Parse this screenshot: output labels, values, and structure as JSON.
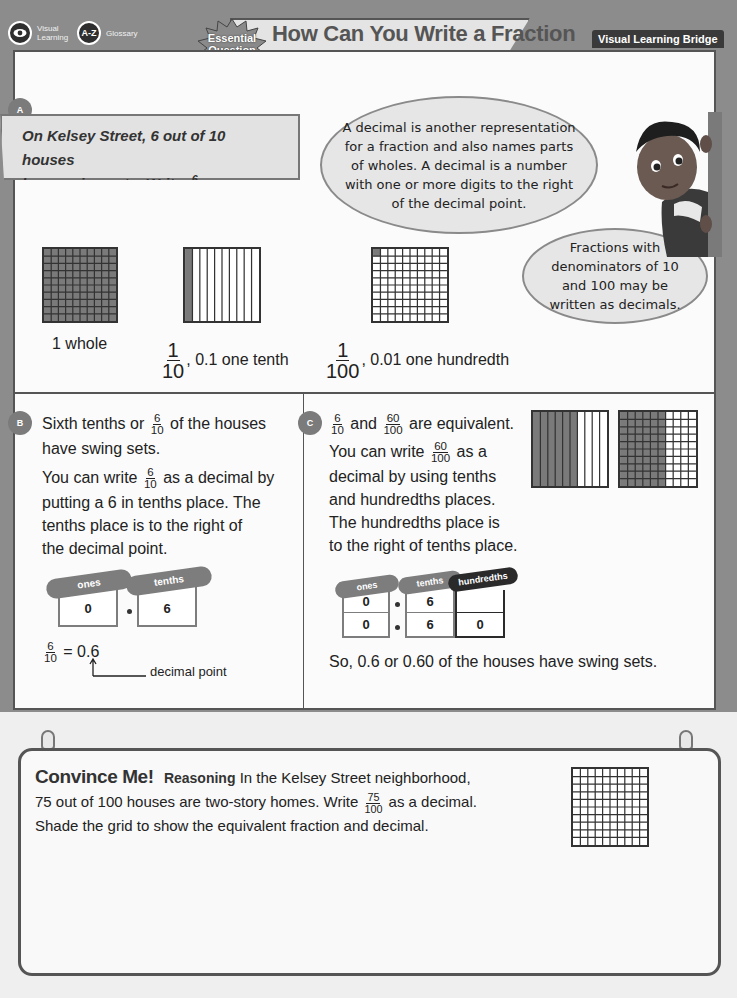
{
  "toolbar": {
    "visual_learning": {
      "label_line1": "Visual",
      "label_line2": "Learning",
      "icon": "eye-icon"
    },
    "glossary": {
      "icon_text": "A-Z",
      "label": "Glossary"
    }
  },
  "header": {
    "badge_line1": "Essential",
    "badge_line2": "Question",
    "title_line1": "How Can You Write a Fraction",
    "title_line2": "as a Decimal?",
    "section_label": "Visual Learning Bridge"
  },
  "section_a": {
    "badge": "A",
    "problem": {
      "line1": "On Kelsey Street, 6 out of 10 houses",
      "line2_pre": "have swing sets. Write",
      "frac_num": "6",
      "frac_den": "10",
      "line2_post": "as a decimal."
    },
    "bubble_main": "A decimal is another representation for a fraction and also names parts of wholes. A decimal is a number with one or more digits to the right of the decimal point.",
    "bubble_small": "Fractions with denominators of 10 and 100 may be written as decimals.",
    "models": [
      {
        "type": "whole",
        "label": "1 whole"
      },
      {
        "type": "tenth",
        "frac_num": "1",
        "frac_den": "10",
        "label": ", 0.1 one tenth"
      },
      {
        "type": "hundredth",
        "frac_num": "1",
        "frac_den": "100",
        "label": ", 0.01 one hundredth"
      }
    ]
  },
  "section_b": {
    "badge": "B",
    "p1_pre": "Sixth tenths or",
    "p1_frac_num": "6",
    "p1_frac_den": "10",
    "p1_post": "of the houses",
    "p1_line2": "have swing sets.",
    "p2_pre": "You can write",
    "p2_frac_num": "6",
    "p2_frac_den": "10",
    "p2_post": "as a decimal by",
    "p2_line2": "putting a 6 in tenths place. The",
    "p2_line3": "tenths place is to the right of",
    "p2_line4": "the decimal point.",
    "place_value": {
      "ones_label": "ones",
      "tenths_label": "tenths",
      "ones_value": "0",
      "tenths_value": "6"
    },
    "equation": {
      "frac_num": "6",
      "frac_den": "10",
      "result": "= 0.6"
    },
    "arrow_label": "decimal point"
  },
  "section_c": {
    "badge": "C",
    "p1_frac1_num": "6",
    "p1_frac1_den": "10",
    "p1_mid": "and",
    "p1_frac2_num": "60",
    "p1_frac2_den": "100",
    "p1_post": "are equivalent.",
    "p2_pre": "You can write",
    "p2_frac_num": "60",
    "p2_frac_den": "100",
    "p2_post": "as a",
    "p2_line2": "decimal by using tenths",
    "p2_line3": "and hundredths places.",
    "p2_line4": "The hundredths place is",
    "p2_line5": "to the right of tenths place.",
    "place_value": {
      "ones_label": "ones",
      "tenths_label": "tenths",
      "hundredths_label": "hundredths",
      "row1": {
        "ones": "0",
        "tenths": "6",
        "hundredths": ""
      },
      "row2": {
        "ones": "0",
        "tenths": "6",
        "hundredths": "0"
      }
    },
    "conclusion": "So, 0.6 or 0.60 of the houses have swing sets.",
    "tenths_model_shaded": 6,
    "hundredths_model_shaded_columns": 6
  },
  "convince_me": {
    "title": "Convince Me!",
    "practice": "Reasoning",
    "line1": "In the Kelsey Street neighborhood,",
    "line2_pre": "75 out of 100 houses are two-story homes. Write",
    "frac_num": "75",
    "frac_den": "100",
    "line2_post": "as a decimal.",
    "line3": "Shade the grid to show the equivalent fraction and decimal.",
    "grid_size": 10
  }
}
